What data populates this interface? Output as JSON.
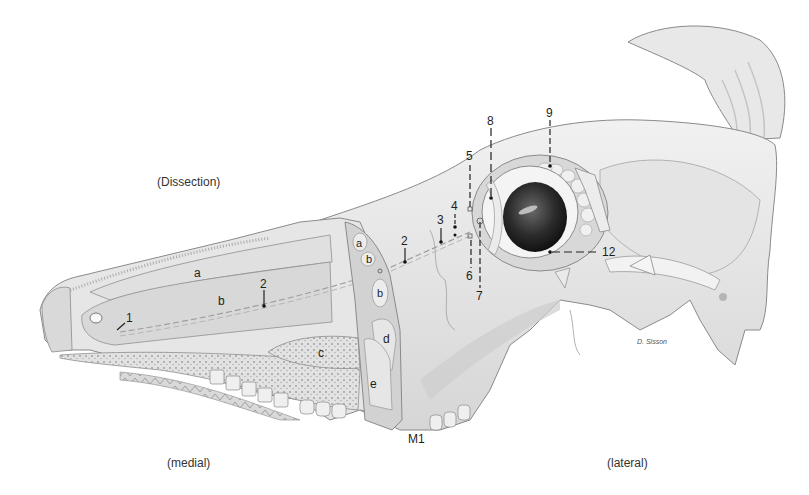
{
  "figure": {
    "captions": {
      "top_left": "(Dissection)",
      "bottom_left": "(medial)",
      "bottom_right": "(lateral)"
    },
    "signature": "D. Sisson",
    "colors": {
      "background": "#ffffff",
      "bone": "#e9e9e9",
      "bone_shadow": "#cfcfcf",
      "outline": "#8a8a8a",
      "sinus_cavity": "#dcdcdc",
      "eye_dark": "#2a2a2a",
      "leader_line": "#222222"
    },
    "region_labels": [
      {
        "id": "a",
        "text": "a",
        "x": 226,
        "y": 272
      },
      {
        "id": "b",
        "text": "b",
        "x": 219,
        "y": 300
      },
      {
        "id": "c",
        "text": "c",
        "x": 320,
        "y": 352
      },
      {
        "id": "a2",
        "text": "a",
        "x": 356,
        "y": 243
      },
      {
        "id": "b2",
        "text": "b",
        "x": 367,
        "y": 259
      },
      {
        "id": "b3",
        "text": "b",
        "x": 378,
        "y": 293
      },
      {
        "id": "d",
        "text": "d",
        "x": 384,
        "y": 339
      },
      {
        "id": "e",
        "text": "e",
        "x": 371,
        "y": 383
      },
      {
        "id": "M1",
        "text": "M1",
        "x": 407,
        "y": 437
      }
    ],
    "numbered_labels": [
      {
        "id": "1",
        "text": "1",
        "x": 127,
        "y": 318
      },
      {
        "id": "2a",
        "text": "2",
        "x": 262,
        "y": 283
      },
      {
        "id": "2b",
        "text": "2",
        "x": 403,
        "y": 240
      },
      {
        "id": "3",
        "text": "3",
        "x": 437,
        "y": 219
      },
      {
        "id": "4",
        "text": "4",
        "x": 451,
        "y": 206
      },
      {
        "id": "5",
        "text": "5",
        "x": 467,
        "y": 156
      },
      {
        "id": "6",
        "text": "6",
        "x": 467,
        "y": 270
      },
      {
        "id": "7",
        "text": "7",
        "x": 477,
        "y": 290
      },
      {
        "id": "8",
        "text": "8",
        "x": 487,
        "y": 117
      },
      {
        "id": "9",
        "text": "9",
        "x": 546,
        "y": 110
      },
      {
        "id": "12",
        "text": "12",
        "x": 604,
        "y": 251
      }
    ]
  }
}
